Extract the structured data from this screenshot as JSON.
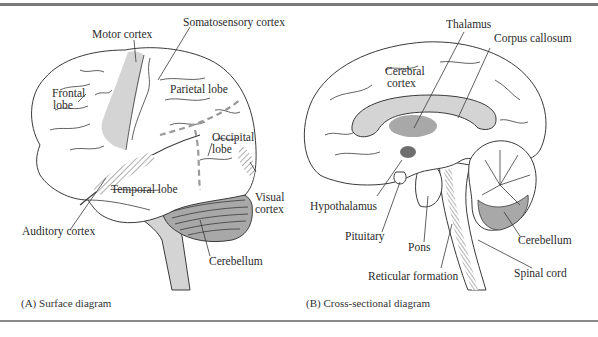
{
  "figure": {
    "panels": [
      {
        "id": "A",
        "caption": "(A) Surface diagram",
        "labels": {
          "motor_cortex": "Motor cortex",
          "somatosensory_cortex": "Somatosensory cortex",
          "frontal_lobe_1": "Frontal",
          "frontal_lobe_2": "lobe",
          "parietal_lobe": "Parietal lobe",
          "occipital_lobe_1": "Occipital",
          "occipital_lobe_2": "lobe",
          "temporal_lobe": "Temporal lobe",
          "visual_cortex_1": "Visual",
          "visual_cortex_2": "cortex",
          "auditory_cortex": "Auditory cortex",
          "cerebellum": "Cerebellum"
        }
      },
      {
        "id": "B",
        "caption": "(B) Cross-sectional diagram",
        "labels": {
          "thalamus": "Thalamus",
          "corpus_callosum": "Corpus callosum",
          "cerebral_cortex_1": "Cerebral",
          "cerebral_cortex_2": "cortex",
          "hypothalamus": "Hypothalamus",
          "pituitary": "Pituitary",
          "pons": "Pons",
          "reticular_formation": "Reticular formation",
          "cerebellum": "Cerebellum",
          "spinal_cord": "Spinal cord"
        }
      }
    ],
    "colors": {
      "light_fill": "#d4d4d4",
      "medium_fill": "#a8a8a8",
      "dark_fill": "#6e6e6e",
      "line": "#3a3a3a",
      "rule": "#7a7a7a"
    }
  }
}
